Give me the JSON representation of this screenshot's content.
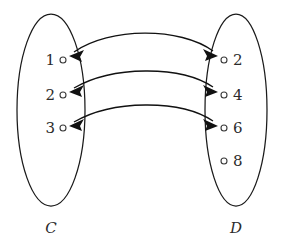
{
  "figure": {
    "type": "set-mapping-diagram",
    "background_color": "#ffffff",
    "stroke_color": "#111111",
    "text_color": "#2b2b2b"
  },
  "sets": {
    "left": {
      "name": "C",
      "label": "C",
      "elements": [
        {
          "label": "1",
          "marker": "open-circle",
          "x": 63,
          "y": 60,
          "label_x": 55,
          "label_y": 65
        },
        {
          "label": "2",
          "marker": "open-circle",
          "x": 63,
          "y": 95,
          "label_x": 55,
          "label_y": 100
        },
        {
          "label": "3",
          "marker": "open-circle",
          "x": 63,
          "y": 128,
          "label_x": 55,
          "label_y": 133
        }
      ],
      "ellipse": {
        "cx": 51,
        "cy": 110,
        "rx": 34,
        "ry": 97
      },
      "label_x": 51,
      "label_y": 233
    },
    "right": {
      "name": "D",
      "label": "D",
      "elements": [
        {
          "label": "2",
          "marker": "open-circle",
          "x": 224,
          "y": 60,
          "label_x": 234,
          "label_y": 65
        },
        {
          "label": "4",
          "marker": "open-circle",
          "x": 224,
          "y": 95,
          "label_x": 234,
          "label_y": 100
        },
        {
          "label": "6",
          "marker": "open-circle",
          "x": 224,
          "y": 128,
          "label_x": 234,
          "label_y": 133
        },
        {
          "label": "8",
          "marker": "open-circle",
          "x": 224,
          "y": 161,
          "label_x": 234,
          "label_y": 166
        }
      ],
      "ellipse": {
        "cx": 236,
        "cy": 110,
        "rx": 32,
        "ry": 97
      },
      "label_x": 236,
      "label_y": 233
    }
  },
  "mappings": [
    {
      "from": "1",
      "to": "2",
      "direction": "both",
      "arrowheads": 2
    },
    {
      "from": "2",
      "to": "4",
      "direction": "both",
      "arrowheads": 2
    },
    {
      "from": "3",
      "to": "6",
      "direction": "both",
      "arrowheads": 2
    }
  ],
  "unmapped": [
    {
      "set": "D",
      "label": "8"
    }
  ]
}
